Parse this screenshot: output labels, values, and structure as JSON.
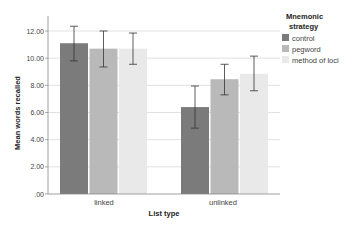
{
  "chart_data": {
    "type": "bar",
    "title": "",
    "xlabel": "List type",
    "ylabel": "Mean words recalled",
    "categories": [
      "linked",
      "unlinked"
    ],
    "ylim": [
      0,
      12
    ],
    "yticks": [
      ".00",
      "2.00",
      "4.00",
      "6.00",
      "8.00",
      "10.00",
      "12.00"
    ],
    "grid": true,
    "legend": {
      "title": "Mnemonic strategy",
      "position": "right"
    },
    "series": [
      {
        "name": "control",
        "color": "#7b7b7b",
        "values": [
          11.1,
          6.4
        ],
        "err_low": [
          9.8,
          4.85
        ],
        "err_high": [
          12.35,
          7.95
        ]
      },
      {
        "name": "pegword",
        "color": "#b9b9b9",
        "values": [
          10.7,
          8.45
        ],
        "err_low": [
          9.35,
          7.3
        ],
        "err_high": [
          12.0,
          9.55
        ]
      },
      {
        "name": "method of loci",
        "color": "#e9e9e9",
        "values": [
          10.7,
          8.85
        ],
        "err_low": [
          9.55,
          7.6
        ],
        "err_high": [
          11.85,
          10.15
        ]
      }
    ]
  },
  "legend": {
    "title_line1": "Mnemonic",
    "title_line2": "strategy",
    "items": [
      "control",
      "pegword",
      "method of loci"
    ]
  },
  "axes": {
    "xlabel": "List type",
    "ylabel": "Mean words recalled",
    "categories": [
      "linked",
      "unlinked"
    ],
    "yticks": [
      ".00",
      "2.00",
      "4.00",
      "6.00",
      "8.00",
      "10.00",
      "12.00"
    ]
  }
}
